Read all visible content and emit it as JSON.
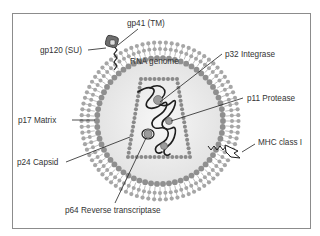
{
  "labels": {
    "gp41": "gp41 (TM)",
    "gp120": "gp120 (SU)",
    "rna": "RNA genome",
    "p32": "p32 Integrase",
    "p17": "p17 Matrix",
    "p11": "p11 Protease",
    "mhc": "MHC class I",
    "p24": "p24 Capsid",
    "p64": "p64 Reverse transcriptase"
  },
  "colors": {
    "lipid_head": "#a6a6a6",
    "matrix_bead": "#8f8f8f",
    "capsid_bead": "#8a8a8a",
    "interior": "#ececec",
    "line": "#222222",
    "enzyme": "#9a9a9a",
    "gp120": "#6e6e6e"
  }
}
